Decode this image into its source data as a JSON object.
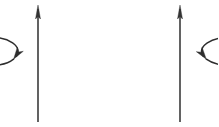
{
  "figure": {
    "caption": "",
    "width": 218,
    "height": 127,
    "background_color": "#ffffff",
    "stroke_color": "#2e2e2e",
    "axis_color": "#3b3b3b"
  },
  "chart_data": {
    "type": "diagram",
    "title": "Rotation direction about a vertical axis",
    "xlabel": "",
    "ylabel": "",
    "items": [
      {
        "name": "left-rotation-figure",
        "axis": {
          "label": "",
          "x": 38,
          "y_top": 6,
          "y_bottom": 122,
          "arrow_direction": "up",
          "arrowhead_length": 14,
          "arrowhead_width": 5
        },
        "orbit": {
          "label": "",
          "center_x": 38,
          "center_y": 64,
          "radius_x": 26,
          "radius_y": 14,
          "rotation_sense": "counterclockwise",
          "arrowhead_position": "bottom-left",
          "arrowhead_angle_deg": 200
        }
      },
      {
        "name": "right-rotation-figure",
        "axis": {
          "label": "",
          "x": 180,
          "y_top": 6,
          "y_bottom": 122,
          "arrow_direction": "up",
          "arrowhead_length": 14,
          "arrowhead_width": 5
        },
        "orbit": {
          "label": "",
          "center_x": 180,
          "center_y": 64,
          "radius_x": 28,
          "radius_y": 14,
          "rotation_sense": "clockwise",
          "arrowhead_position": "bottom-right",
          "arrowhead_angle_deg": 340
        }
      }
    ],
    "annotations": [],
    "legend": [],
    "grid": false
  }
}
